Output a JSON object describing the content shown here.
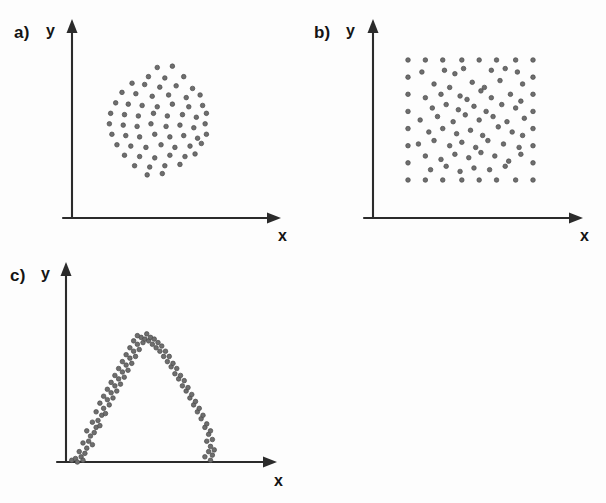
{
  "figure": {
    "background_color": "#fdfdfd",
    "ink_color": "#2b2b2b",
    "marker_color": "#6e6e6e"
  },
  "panels": [
    {
      "id": "a",
      "label": "a)",
      "xlabel": "x",
      "ylabel": "y"
    },
    {
      "id": "b",
      "label": "b)",
      "xlabel": "x",
      "ylabel": "y"
    },
    {
      "id": "c",
      "label": "c)",
      "xlabel": "x",
      "ylabel": "y"
    }
  ],
  "chart_data": [
    {
      "type": "scatter",
      "title": "a)",
      "xlabel": "x",
      "ylabel": "y",
      "subtitle": "Circular (disk-shaped) point cloud centred in the first quadrant",
      "grid": false,
      "legend": "none",
      "xlim": [
        0,
        100
      ],
      "ylim": [
        0,
        100
      ],
      "axis_style": "arrowed-axes-no-ticks",
      "shape": "disk",
      "center": [
        51,
        54
      ],
      "radius": 38,
      "n_points": 66,
      "points": [
        [
          51,
          92
        ],
        [
          63,
          93
        ],
        [
          44,
          85
        ],
        [
          57,
          84
        ],
        [
          72,
          85
        ],
        [
          31,
          80
        ],
        [
          41,
          79
        ],
        [
          53,
          77
        ],
        [
          66,
          78
        ],
        [
          79,
          76
        ],
        [
          23,
          73
        ],
        [
          34,
          72
        ],
        [
          47,
          70
        ],
        [
          60,
          71
        ],
        [
          74,
          69
        ],
        [
          85,
          71
        ],
        [
          18,
          65
        ],
        [
          28,
          64
        ],
        [
          39,
          63
        ],
        [
          51,
          62
        ],
        [
          63,
          64
        ],
        [
          76,
          62
        ],
        [
          87,
          63
        ],
        [
          14,
          57
        ],
        [
          25,
          56
        ],
        [
          36,
          55
        ],
        [
          48,
          57
        ],
        [
          59,
          55
        ],
        [
          71,
          56
        ],
        [
          82,
          54
        ],
        [
          90,
          57
        ],
        [
          13,
          49
        ],
        [
          24,
          48
        ],
        [
          35,
          47
        ],
        [
          46,
          49
        ],
        [
          58,
          47
        ],
        [
          69,
          48
        ],
        [
          80,
          46
        ],
        [
          89,
          49
        ],
        [
          15,
          41
        ],
        [
          26,
          40
        ],
        [
          37,
          39
        ],
        [
          49,
          41
        ],
        [
          61,
          39
        ],
        [
          72,
          40
        ],
        [
          83,
          38
        ],
        [
          90,
          41
        ],
        [
          19,
          33
        ],
        [
          30,
          32
        ],
        [
          42,
          31
        ],
        [
          54,
          33
        ],
        [
          65,
          31
        ],
        [
          77,
          32
        ],
        [
          86,
          34
        ],
        [
          25,
          25
        ],
        [
          37,
          24
        ],
        [
          49,
          23
        ],
        [
          61,
          25
        ],
        [
          73,
          24
        ],
        [
          81,
          26
        ],
        [
          33,
          17
        ],
        [
          45,
          16
        ],
        [
          57,
          17
        ],
        [
          69,
          18
        ],
        [
          43,
          10
        ],
        [
          55,
          11
        ]
      ]
    },
    {
      "type": "scatter",
      "title": "b)",
      "xlabel": "x",
      "ylabel": "y",
      "subtitle": "Uniform rectangular (square) point cloud with regular border rows and columns",
      "grid": false,
      "legend": "none",
      "xlim": [
        0,
        100
      ],
      "ylim": [
        0,
        100
      ],
      "axis_style": "arrowed-axes-no-ticks",
      "shape": "square",
      "x_range": [
        14,
        86
      ],
      "y_range": [
        16,
        86
      ],
      "n_points": 82,
      "border_points": [
        [
          14,
          86
        ],
        [
          24,
          86
        ],
        [
          34,
          86
        ],
        [
          45,
          86
        ],
        [
          55,
          86
        ],
        [
          65,
          86
        ],
        [
          76,
          86
        ],
        [
          86,
          86
        ],
        [
          14,
          76
        ],
        [
          86,
          76
        ],
        [
          14,
          66
        ],
        [
          86,
          66
        ],
        [
          14,
          56
        ],
        [
          86,
          56
        ],
        [
          14,
          46
        ],
        [
          86,
          46
        ],
        [
          14,
          36
        ],
        [
          86,
          36
        ],
        [
          14,
          26
        ],
        [
          86,
          26
        ],
        [
          14,
          16
        ],
        [
          24,
          16
        ],
        [
          34,
          16
        ],
        [
          45,
          16
        ],
        [
          55,
          16
        ],
        [
          65,
          16
        ],
        [
          76,
          16
        ],
        [
          86,
          16
        ]
      ],
      "interior_points": [
        [
          22,
          79
        ],
        [
          35,
          80
        ],
        [
          41,
          78
        ],
        [
          46,
          81
        ],
        [
          62,
          80
        ],
        [
          70,
          81
        ],
        [
          77,
          79
        ],
        [
          29,
          72
        ],
        [
          38,
          70
        ],
        [
          51,
          73
        ],
        [
          58,
          70
        ],
        [
          67,
          74
        ],
        [
          80,
          72
        ],
        [
          24,
          64
        ],
        [
          33,
          66
        ],
        [
          44,
          65
        ],
        [
          48,
          63
        ],
        [
          56,
          68
        ],
        [
          62,
          64
        ],
        [
          73,
          66
        ],
        [
          79,
          62
        ],
        [
          28,
          58
        ],
        [
          36,
          60
        ],
        [
          43,
          57
        ],
        [
          52,
          59
        ],
        [
          59,
          56
        ],
        [
          68,
          60
        ],
        [
          76,
          58
        ],
        [
          21,
          51
        ],
        [
          31,
          53
        ],
        [
          40,
          50
        ],
        [
          47,
          54
        ],
        [
          55,
          51
        ],
        [
          63,
          53
        ],
        [
          71,
          50
        ],
        [
          81,
          52
        ],
        [
          26,
          44
        ],
        [
          34,
          46
        ],
        [
          42,
          43
        ],
        [
          50,
          45
        ],
        [
          57,
          42
        ],
        [
          66,
          47
        ],
        [
          74,
          44
        ],
        [
          80,
          42
        ],
        [
          20,
          37
        ],
        [
          29,
          39
        ],
        [
          38,
          36
        ],
        [
          45,
          38
        ],
        [
          53,
          35
        ],
        [
          60,
          39
        ],
        [
          69,
          37
        ],
        [
          78,
          35
        ],
        [
          24,
          30
        ],
        [
          33,
          28
        ],
        [
          41,
          31
        ],
        [
          49,
          29
        ],
        [
          56,
          32
        ],
        [
          64,
          30
        ],
        [
          72,
          27
        ],
        [
          79,
          31
        ],
        [
          27,
          22
        ],
        [
          36,
          24
        ],
        [
          44,
          21
        ],
        [
          52,
          23
        ],
        [
          61,
          22
        ],
        [
          70,
          24
        ]
      ]
    },
    {
      "type": "scatter",
      "title": "c)",
      "xlabel": "x",
      "ylabel": "y",
      "subtitle": "Inverted-parabola (arch) shaped point cloud; y peaks at mid-range x and falls to zero at both ends",
      "grid": false,
      "legend": "none",
      "xlim": [
        0,
        100
      ],
      "ylim": [
        0,
        100
      ],
      "axis_style": "arrowed-axes-no-ticks",
      "shape": "inverted-parabola",
      "relationship": "y = a - b*(x - x0)^2  (non-monotonic, zero linear correlation)",
      "vertex": [
        44,
        72
      ],
      "x_zero_crossings": [
        6,
        81
      ],
      "n_points": 96,
      "points": [
        [
          6,
          1
        ],
        [
          8,
          2
        ],
        [
          9,
          0
        ],
        [
          11,
          3
        ],
        [
          12,
          1
        ],
        [
          10,
          6
        ],
        [
          13,
          5
        ],
        [
          14,
          8
        ],
        [
          12,
          11
        ],
        [
          15,
          12
        ],
        [
          17,
          10
        ],
        [
          16,
          15
        ],
        [
          18,
          17
        ],
        [
          14,
          18
        ],
        [
          19,
          20
        ],
        [
          17,
          23
        ],
        [
          20,
          24
        ],
        [
          21,
          21
        ],
        [
          22,
          27
        ],
        [
          19,
          29
        ],
        [
          23,
          31
        ],
        [
          24,
          28
        ],
        [
          21,
          34
        ],
        [
          25,
          36
        ],
        [
          26,
          33
        ],
        [
          23,
          38
        ],
        [
          27,
          40
        ],
        [
          28,
          37
        ],
        [
          25,
          42
        ],
        [
          29,
          44
        ],
        [
          30,
          41
        ],
        [
          27,
          46
        ],
        [
          31,
          48
        ],
        [
          32,
          45
        ],
        [
          29,
          50
        ],
        [
          33,
          52
        ],
        [
          34,
          49
        ],
        [
          31,
          54
        ],
        [
          35,
          56
        ],
        [
          36,
          53
        ],
        [
          33,
          58
        ],
        [
          37,
          60
        ],
        [
          38,
          57
        ],
        [
          35,
          62
        ],
        [
          39,
          64
        ],
        [
          40,
          61
        ],
        [
          37,
          66
        ],
        [
          41,
          68
        ],
        [
          42,
          65
        ],
        [
          39,
          70
        ],
        [
          43,
          72
        ],
        [
          44,
          69
        ],
        [
          41,
          73
        ],
        [
          45,
          71
        ],
        [
          46,
          74
        ],
        [
          47,
          70
        ],
        [
          48,
          72
        ],
        [
          49,
          68
        ],
        [
          50,
          71
        ],
        [
          51,
          66
        ],
        [
          52,
          69
        ],
        [
          53,
          64
        ],
        [
          54,
          67
        ],
        [
          55,
          61
        ],
        [
          56,
          64
        ],
        [
          57,
          58
        ],
        [
          58,
          61
        ],
        [
          59,
          55
        ],
        [
          60,
          57
        ],
        [
          61,
          51
        ],
        [
          62,
          54
        ],
        [
          63,
          48
        ],
        [
          64,
          50
        ],
        [
          65,
          44
        ],
        [
          66,
          47
        ],
        [
          67,
          41
        ],
        [
          68,
          43
        ],
        [
          69,
          37
        ],
        [
          70,
          39
        ],
        [
          71,
          33
        ],
        [
          72,
          35
        ],
        [
          73,
          29
        ],
        [
          74,
          31
        ],
        [
          75,
          25
        ],
        [
          76,
          27
        ],
        [
          77,
          20
        ],
        [
          78,
          22
        ],
        [
          79,
          16
        ],
        [
          80,
          18
        ],
        [
          78,
          12
        ],
        [
          80,
          9
        ],
        [
          81,
          13
        ],
        [
          79,
          6
        ],
        [
          81,
          4
        ],
        [
          80,
          1
        ],
        [
          82,
          7
        ],
        [
          77,
          3
        ]
      ]
    }
  ]
}
